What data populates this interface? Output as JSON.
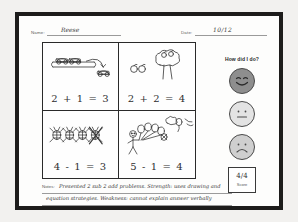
{
  "worksheet": {
    "name_label": "Name:",
    "name_value": "Reese",
    "date_label": "Date:",
    "date_value": "10/12"
  },
  "problems": [
    {
      "id": "problem-1",
      "equation": "2 + 1 = 3",
      "drawing": "cars-on-road",
      "operation": "addition"
    },
    {
      "id": "problem-2",
      "equation": "2 + 2 = 4",
      "drawing": "apples-and-tree",
      "operation": "addition"
    },
    {
      "id": "problem-3",
      "equation": "4 - 1 = 3",
      "drawing": "four-bugs-one-crossed-out",
      "operation": "subtraction"
    },
    {
      "id": "problem-4",
      "equation": "5 - 1 = 4",
      "drawing": "child-with-balloons-one-floating-away",
      "operation": "subtraction"
    }
  ],
  "rating_panel": {
    "title": "How did I do?",
    "faces": [
      {
        "name": "happy-face",
        "state": "selected"
      },
      {
        "name": "neutral-face",
        "state": "unselected"
      },
      {
        "name": "sad-face",
        "state": "unselected"
      }
    ],
    "score_value": "4/4",
    "score_label": "Score"
  },
  "notes": {
    "label": "Notes:",
    "line1": "Presented 2 sub 2 add problems. Strength: uses drawing and",
    "line2": "equation strategies. Weakness: cannot explain answer verbally"
  },
  "colors": {
    "frame": "#1d1c1b",
    "page": "#fdfdfc",
    "ink": "#2f2f2f",
    "rule": "#9a9a9a",
    "face_selected": "#8e8e8e",
    "face_neutral": "#e3e3e3",
    "face_sad": "#cfcfcf"
  }
}
